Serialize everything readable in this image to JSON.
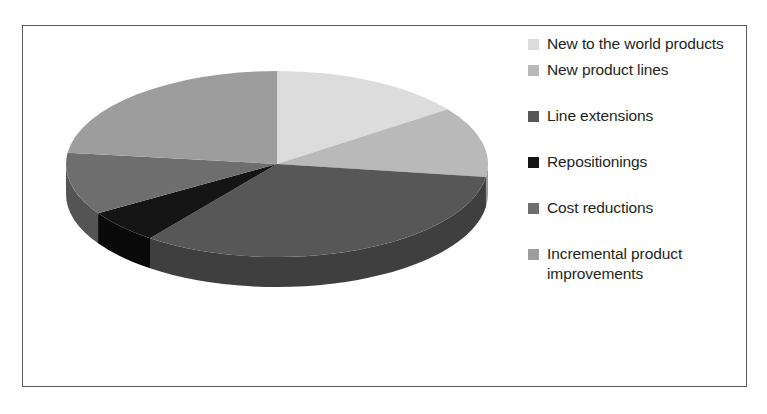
{
  "figure": {
    "frame_border_color": "#555b5e",
    "background": "#ffffff"
  },
  "legend": {
    "position": "right",
    "items": [
      {
        "label": "New to the world products",
        "color": "#dcdcdc",
        "swatch_name": "legend-swatch-new-to-the-world-products"
      },
      {
        "label": "New product lines",
        "color": "#b9b9b9",
        "swatch_name": "legend-swatch-new-product-lines"
      },
      {
        "label": "Line extensions",
        "color": "#575757",
        "swatch_name": "legend-swatch-line-extensions"
      },
      {
        "label": "Repositionings",
        "color": "#151515",
        "swatch_name": "legend-swatch-repositionings"
      },
      {
        "label": "Cost reductions",
        "color": "#6e6e6e",
        "swatch_name": "legend-swatch-cost-reductions"
      },
      {
        "label": "Incremental product improvements",
        "color": "#9d9d9d",
        "swatch_name": "legend-swatch-incremental-product-improvements"
      }
    ]
  },
  "chart_data": {
    "type": "pie",
    "title": "",
    "subtitle": "",
    "xlabel": "",
    "ylabel": "",
    "grid": false,
    "legend_position": "right",
    "three_d": true,
    "start_angle_deg": -90,
    "direction": "clockwise",
    "labels": [
      "New to the world products",
      "New product lines",
      "Line extensions",
      "Repositionings",
      "Cost reductions",
      "Incremental product improvements"
    ],
    "values": [
      15,
      12,
      33,
      6,
      11,
      23
    ],
    "colors": [
      "#dcdcdc",
      "#b9b9b9",
      "#575757",
      "#151515",
      "#6e6e6e",
      "#9d9d9d"
    ],
    "side_colors": [
      "#b5b5b5",
      "#9a9a9a",
      "#3f3f3f",
      "#0a0a0a",
      "#545454",
      "#7d7d7d"
    ],
    "slice_angles_deg": [
      {
        "label": "New to the world products",
        "start": -90,
        "end": -36
      },
      {
        "label": "New product lines",
        "start": -36,
        "end": 8
      },
      {
        "label": "Line extensions",
        "start": 8,
        "end": 127
      },
      {
        "label": "Repositionings",
        "start": 127,
        "end": 148
      },
      {
        "label": "Cost reductions",
        "start": 148,
        "end": 187
      },
      {
        "label": "Incremental product improvements",
        "start": 187,
        "end": 270
      }
    ],
    "geometry": {
      "center_x": 237,
      "center_y": 124,
      "radius_x": 211,
      "radius_y": 93,
      "depth": 30
    }
  }
}
